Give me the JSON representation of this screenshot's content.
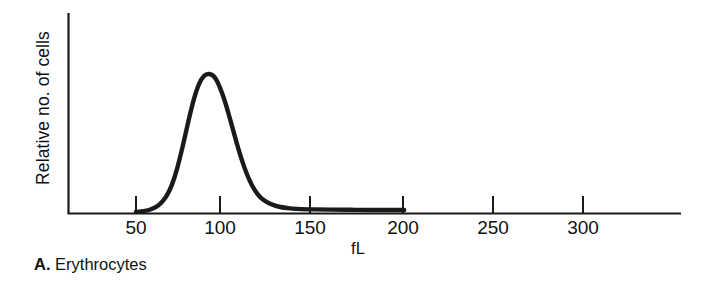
{
  "figure": {
    "panel_letter": "A.",
    "panel_title": "Erythrocytes"
  },
  "axes": {
    "ylabel": "Relative no. of cells",
    "xlabel": "fL"
  },
  "chart_data": {
    "type": "line",
    "title": "A. Erythrocytes",
    "subtitle": "",
    "xlabel": "fL",
    "ylabel": "Relative no. of cells",
    "xlim": [
      20,
      342
    ],
    "ylim": [
      0,
      1.05
    ],
    "xticks": [
      50,
      100,
      150,
      200,
      250,
      300
    ],
    "xtick_labels": [
      "50",
      "100",
      "150",
      "200",
      "250",
      "300"
    ],
    "ytick_labels": [],
    "grid": false,
    "legend": null,
    "series": [
      {
        "name": "Erythrocyte volume distribution",
        "color": "#1a1a1a",
        "x": [
          50,
          52,
          55,
          58,
          61,
          64,
          67,
          70,
          73,
          76,
          79,
          82,
          85,
          88,
          91,
          94,
          97,
          100,
          103,
          106,
          109,
          112,
          115,
          118,
          121,
          125,
          130,
          135,
          140,
          150,
          160,
          170,
          180,
          190,
          200
        ],
        "y": [
          0.0,
          0.003,
          0.008,
          0.018,
          0.035,
          0.065,
          0.115,
          0.195,
          0.315,
          0.47,
          0.64,
          0.8,
          0.92,
          0.985,
          1.0,
          0.975,
          0.9,
          0.79,
          0.655,
          0.515,
          0.385,
          0.275,
          0.19,
          0.13,
          0.09,
          0.06,
          0.038,
          0.028,
          0.023,
          0.019,
          0.017,
          0.016,
          0.015,
          0.015,
          0.015
        ]
      }
    ],
    "annotations": {
      "peak_x": 92,
      "peak_y": 1.0,
      "data_start_x": 50,
      "data_end_x": 200
    }
  }
}
